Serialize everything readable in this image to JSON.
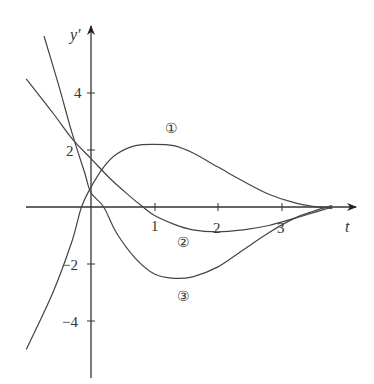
{
  "chart_data": {
    "type": "line",
    "title": "",
    "xlabel": "t",
    "ylabel": "y'",
    "xlim": [
      -1.0,
      4.2
    ],
    "ylim": [
      -6.0,
      6.4
    ],
    "grid": false,
    "legend": "inline circled numbers",
    "x_ticks": [
      1,
      2,
      3
    ],
    "x_tick_labels": [
      "1",
      "2",
      "3"
    ],
    "y_ticks": [
      4,
      2,
      -2,
      -4
    ],
    "y_tick_labels": [
      "4",
      "2",
      "−2",
      "−4"
    ],
    "series": [
      {
        "name": "①",
        "x": [
          -1.02,
          -0.6,
          -0.3,
          -0.15,
          0.0,
          0.2,
          0.4,
          0.7,
          1.0,
          1.3,
          1.6,
          2.0,
          2.4,
          2.8,
          3.2,
          3.5,
          3.8
        ],
        "y": [
          -5.0,
          -3.0,
          -1.2,
          0.0,
          0.7,
          1.4,
          1.85,
          2.15,
          2.2,
          2.15,
          1.9,
          1.4,
          0.9,
          0.45,
          0.15,
          0.02,
          -0.05
        ]
      },
      {
        "name": "②",
        "x": [
          -1.02,
          -0.6,
          -0.3,
          0.0,
          0.3,
          0.6,
          0.82,
          1.0,
          1.3,
          1.6,
          2.0,
          2.4,
          2.8,
          3.2,
          3.5,
          3.8
        ],
        "y": [
          4.5,
          3.3,
          2.4,
          1.7,
          1.0,
          0.4,
          0.0,
          -0.3,
          -0.6,
          -0.8,
          -0.87,
          -0.8,
          -0.65,
          -0.4,
          -0.2,
          0.0
        ]
      },
      {
        "name": "③",
        "x": [
          -0.74,
          -0.5,
          -0.3,
          -0.1,
          0.0,
          0.2,
          0.4,
          0.7,
          1.0,
          1.3,
          1.6,
          2.0,
          2.4,
          2.8,
          3.2,
          3.5,
          3.8
        ],
        "y": [
          6.0,
          4.2,
          2.6,
          1.2,
          0.5,
          0.0,
          -0.9,
          -1.8,
          -2.35,
          -2.5,
          -2.45,
          -2.1,
          -1.5,
          -0.9,
          -0.4,
          -0.15,
          0.05
        ]
      }
    ],
    "annotations": [
      {
        "text": "①",
        "x": 1.26,
        "y": 2.75
      },
      {
        "text": "②",
        "x": 1.45,
        "y": -1.23
      },
      {
        "text": "③",
        "x": 1.45,
        "y": -3.12
      }
    ]
  },
  "labels": {
    "y_axis": "y′",
    "x_axis": "t",
    "tick_x1": "1",
    "tick_x2": "2",
    "tick_x3": "3",
    "tick_y4": "4",
    "tick_y2": "2",
    "tick_ym2": "−2",
    "tick_ym4": "−4",
    "curve1": "①",
    "curve2": "②",
    "curve3": "③"
  }
}
